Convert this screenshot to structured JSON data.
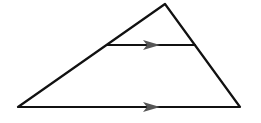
{
  "diagram": {
    "type": "triangle-with-parallel-segment",
    "vertices": {
      "apex": [
        165,
        4
      ],
      "bottom_left": [
        18,
        107
      ],
      "bottom_right": [
        240,
        107
      ]
    },
    "midsegment": {
      "start": [
        107,
        45
      ],
      "end": [
        195,
        45
      ]
    },
    "parallel_marks": [
      {
        "on": "midsegment",
        "tip": [
          160,
          45
        ],
        "direction": "right"
      },
      {
        "on": "base",
        "tip": [
          160,
          107
        ],
        "direction": "right"
      }
    ],
    "colors": {
      "line": "#111111",
      "arrow": "#555555",
      "background": "#ffffff"
    }
  }
}
